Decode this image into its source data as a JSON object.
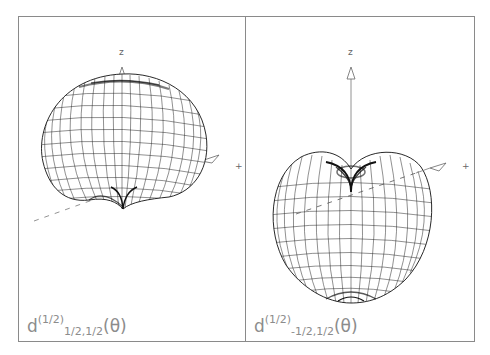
{
  "figure": {
    "panels": [
      {
        "id": "left",
        "caption": {
          "base": "d",
          "superscript": "(1/2)",
          "subscript": "1/2,1/2",
          "argument": "(θ)"
        },
        "axes": {
          "z_label": "z",
          "x_label": "+"
        },
        "shape": "wireframe surface with dimple at bottom (cardioid-like)"
      },
      {
        "id": "right",
        "caption": {
          "base": "d",
          "superscript": "(1/2)",
          "subscript": "-1/2,1/2",
          "argument": "(θ)"
        },
        "axes": {
          "z_label": "z",
          "x_label": "+"
        },
        "shape": "wireframe surface with dimple at top"
      }
    ],
    "colors": {
      "frame": "#8a8a8a",
      "mesh": "#1a1a1a",
      "axis": "#777777",
      "caption": "#8c8c8c"
    }
  }
}
